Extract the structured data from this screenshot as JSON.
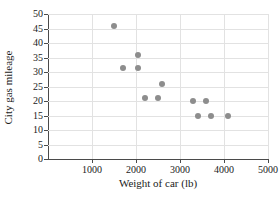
{
  "chart_data": {
    "type": "scatter",
    "title": "",
    "xlabel": "Weight of car (lb)",
    "ylabel": "City gas mileage",
    "xlim": [
      0,
      5000
    ],
    "ylim": [
      0,
      50
    ],
    "xticks": [
      1000,
      2000,
      3000,
      4000,
      5000
    ],
    "yticks": [
      0,
      5,
      10,
      15,
      20,
      25,
      30,
      35,
      40,
      45,
      50
    ],
    "xtick_labels": [
      "1000",
      "2000",
      "3000",
      "4000",
      "5000"
    ],
    "ytick_labels": [
      "0",
      "5",
      "10",
      "15",
      "20",
      "25",
      "30",
      "35",
      "40",
      "45",
      "50"
    ],
    "grid": true,
    "legend": null,
    "marker_color": "#8d8d8d",
    "points": [
      {
        "x": 1500,
        "y": 46
      },
      {
        "x": 1700,
        "y": 31.5
      },
      {
        "x": 2050,
        "y": 36
      },
      {
        "x": 2050,
        "y": 31.5
      },
      {
        "x": 2200,
        "y": 21
      },
      {
        "x": 2500,
        "y": 21
      },
      {
        "x": 2600,
        "y": 26
      },
      {
        "x": 3300,
        "y": 20
      },
      {
        "x": 3400,
        "y": 15
      },
      {
        "x": 3600,
        "y": 20
      },
      {
        "x": 3700,
        "y": 15
      },
      {
        "x": 4100,
        "y": 15
      }
    ]
  }
}
